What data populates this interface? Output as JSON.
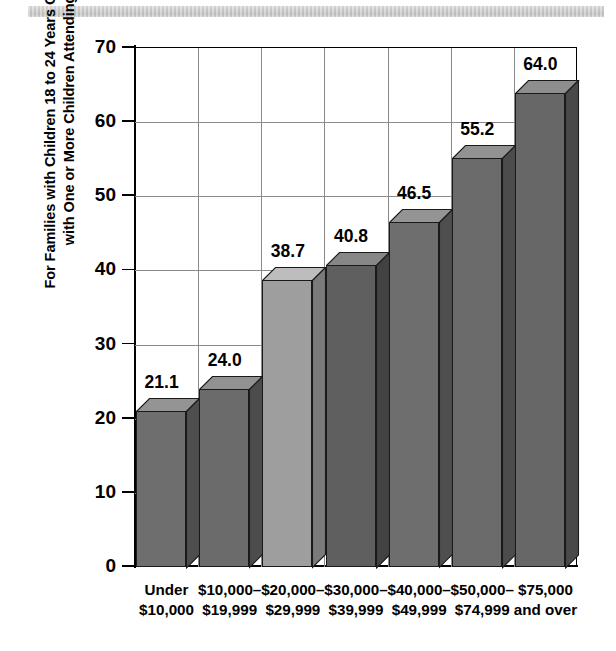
{
  "chart_data": {
    "type": "bar",
    "title": "",
    "xlabel": "",
    "ylabel": "For Families with Children 18 to 24 Years Old, Percentage\nwith One or More Children Attending College",
    "categories": [
      "Under\n$10,000",
      "$10,000–\n$19,999",
      "$20,000–\n$29,999",
      "$30,000–\n$39,999",
      "$40,000–\n$49,999",
      "$50,000–\n$74,999",
      "$75,000\nand over"
    ],
    "values": [
      21.1,
      24.0,
      38.7,
      40.8,
      46.5,
      55.2,
      64.0
    ],
    "value_labels": [
      "21.1",
      "24.0",
      "38.7",
      "40.8",
      "46.5",
      "55.2",
      "64.0"
    ],
    "ylim": [
      0,
      70
    ],
    "ytick_values": [
      0,
      10,
      20,
      30,
      40,
      50,
      60,
      70
    ],
    "ytick_labels": [
      "0",
      "10",
      "20",
      "30",
      "40",
      "50",
      "60",
      "70"
    ],
    "grid": true,
    "legend": null,
    "style": "3d-bar",
    "bar_colors": [
      "#6e6e6e",
      "#6b6b6b",
      "#9e9e9e",
      "#5f5f5f",
      "#6e6e6e",
      "#6b6b6b",
      "#676767"
    ],
    "bar_top_colors": [
      "#949494",
      "#929292",
      "#bdbdbd",
      "#878787",
      "#949494",
      "#929292",
      "#8e8e8e"
    ],
    "bar_side_colors": [
      "#4e4e4e",
      "#4c4c4c",
      "#7a7a7a",
      "#424242",
      "#4e4e4e",
      "#4c4c4c",
      "#494949"
    ],
    "axis_color": "#000000",
    "grid_color": "#8a8a8a"
  }
}
